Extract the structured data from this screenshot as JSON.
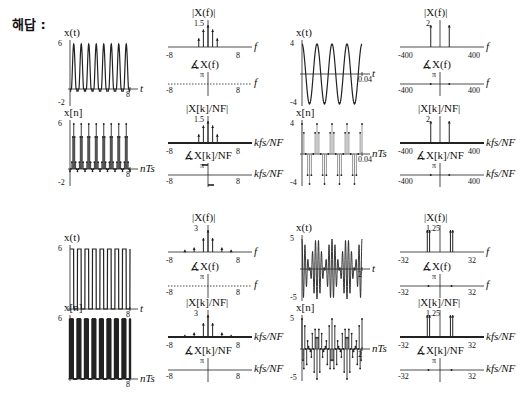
{
  "answer_label": "해답 :",
  "labels": {
    "xt": "x(t)",
    "xn": "x[n]",
    "mag_f": "|X(f)|",
    "phase_f": "∡X(f)",
    "mag_k": "|X[k]/N_F|",
    "phase_k": "∡X[k]/N_F",
    "t": "t",
    "f": "f",
    "nTs": "nT_s",
    "kfs": "kf_s/N_F",
    "pi": "π",
    "neg_pi": "-π"
  },
  "chart_data": [
    {
      "id": "panel-a",
      "type": "line",
      "title": "x(t) periodic pulse train",
      "time": {
        "xlabel": "t",
        "ylabel": "x(t)",
        "xlim": [
          0,
          8
        ],
        "ylim": [
          -2,
          6
        ],
        "ticks_x": [
          "8"
        ],
        "ticks_y": [
          "6",
          "-2"
        ],
        "periods": 8,
        "shape": "raised-cosine pulses"
      },
      "sampled": {
        "xlabel": "nT_s",
        "ylabel": "x[n]",
        "xlim": [
          0,
          8
        ],
        "ylim": [
          -2,
          6
        ],
        "ticks_x": [
          "8"
        ],
        "ticks_y": [
          "6",
          "-2"
        ]
      },
      "mag_f": {
        "xlabel": "f",
        "xlim": [
          -8,
          8
        ],
        "ticks_x": [
          "-8",
          "8"
        ],
        "peak_label": "1.5",
        "impulses": [
          {
            "f": -2,
            "v": 0.6
          },
          {
            "f": -1,
            "v": 1.2
          },
          {
            "f": 0,
            "v": 1.5
          },
          {
            "f": 1,
            "v": 1.2
          },
          {
            "f": 2,
            "v": 0.6
          }
        ]
      },
      "phase_f": {
        "xlabel": "f",
        "xlim": [
          -8,
          8
        ],
        "ticks_x": [
          "-8",
          "8"
        ],
        "ticks_y": [
          "π",
          "-π"
        ],
        "note": "zero phase (dotted)"
      },
      "mag_k": {
        "xlabel": "kf_s/N_F",
        "xlim": [
          -8,
          8
        ],
        "ticks_x": [
          "-8",
          "8"
        ],
        "peak_label": "1.5",
        "impulses": [
          {
            "f": -2,
            "v": 0.6
          },
          {
            "f": -1,
            "v": 1.2
          },
          {
            "f": 0,
            "v": 1.5
          },
          {
            "f": 1,
            "v": 1.2
          },
          {
            "f": 2,
            "v": 0.6
          }
        ]
      },
      "phase_k": {
        "xlabel": "kf_s/N_F",
        "xlim": [
          -8,
          8
        ],
        "ticks_x": [
          "-8",
          "8"
        ],
        "ticks_y": [
          "π",
          "-π"
        ],
        "segments": [
          {
            "f": -0.5,
            "v": 1
          },
          {
            "f": 0.5,
            "v": -1
          }
        ]
      }
    },
    {
      "id": "panel-b",
      "type": "line",
      "title": "x(t) sinusoid",
      "time": {
        "xlabel": "t",
        "ylabel": "x(t)",
        "xlim": [
          0,
          0.04
        ],
        "ylim": [
          -4,
          4
        ],
        "ticks_x": [
          "0.04"
        ],
        "ticks_y": [
          "4",
          "-4"
        ],
        "periods": 4,
        "shape": "cosine, amplitude 4"
      },
      "sampled": {
        "xlabel": "nT_s",
        "ylabel": "x[n]",
        "xlim": [
          0,
          0.04
        ],
        "ylim": [
          -4,
          4
        ],
        "ticks_x": [
          "0.04"
        ],
        "ticks_y": [
          "4",
          "-4"
        ]
      },
      "mag_f": {
        "xlabel": "f",
        "xlim": [
          -400,
          400
        ],
        "ticks_x": [
          "-400",
          "400"
        ],
        "peak_label": "2",
        "impulses": [
          {
            "f": -100,
            "v": 2
          },
          {
            "f": 100,
            "v": 2
          }
        ]
      },
      "phase_f": {
        "xlabel": "f",
        "xlim": [
          -400,
          400
        ],
        "ticks_x": [
          "-400",
          "400"
        ],
        "ticks_y": [
          "π",
          "-π"
        ],
        "points": [
          {
            "f": -100,
            "v": 0
          },
          {
            "f": 100,
            "v": 0
          }
        ]
      },
      "mag_k": {
        "xlabel": "kf_s/N_F",
        "xlim": [
          -400,
          400
        ],
        "ticks_x": [
          "-400",
          "400"
        ],
        "peak_label": "2",
        "impulses": [
          {
            "f": -100,
            "v": 2
          },
          {
            "f": 100,
            "v": 2
          }
        ]
      },
      "phase_k": {
        "xlabel": "kf_s/N_F",
        "xlim": [
          -400,
          400
        ],
        "ticks_x": [
          "-400",
          "400"
        ],
        "ticks_y": [
          "π",
          "-π"
        ],
        "points": [
          {
            "f": -100,
            "v": 0
          },
          {
            "f": 100,
            "v": 0
          }
        ]
      }
    },
    {
      "id": "panel-c",
      "type": "line",
      "title": "x(t) rectangular pulse train",
      "time": {
        "xlabel": "t",
        "ylabel": "x(t)",
        "xlim": [
          0,
          8
        ],
        "ylim": [
          0,
          6
        ],
        "ticks_x": [
          "8"
        ],
        "ticks_y": [
          "6"
        ],
        "periods": 8,
        "shape": "rectangular pulses, 50% duty"
      },
      "sampled": {
        "xlabel": "nT_s",
        "ylabel": "x[n]",
        "xlim": [
          0,
          8
        ],
        "ylim": [
          0,
          6
        ],
        "ticks_x": [
          "8"
        ],
        "ticks_y": [
          "6"
        ]
      },
      "mag_f": {
        "xlabel": "f",
        "xlim": [
          -8,
          8
        ],
        "ticks_x": [
          "-8",
          "8"
        ],
        "peak_label": "3",
        "impulses": [
          {
            "f": -5,
            "v": 0.3
          },
          {
            "f": -3,
            "v": 0.6
          },
          {
            "f": -1,
            "v": 1.9
          },
          {
            "f": 0,
            "v": 3
          },
          {
            "f": 1,
            "v": 1.9
          },
          {
            "f": 3,
            "v": 0.6
          },
          {
            "f": 5,
            "v": 0.3
          }
        ]
      },
      "phase_f": {
        "xlabel": "f",
        "xlim": [
          -8,
          8
        ],
        "ticks_x": [
          "-8",
          "8"
        ],
        "ticks_y": [
          "π",
          "-π"
        ],
        "note": "dots at ±π/2 levels"
      },
      "mag_k": {
        "xlabel": "kf_s/N_F",
        "xlim": [
          -8,
          8
        ],
        "ticks_x": [
          "-8",
          "8"
        ],
        "peak_label": "3",
        "impulses": [
          {
            "f": -5,
            "v": 0.3
          },
          {
            "f": -3,
            "v": 0.6
          },
          {
            "f": -1,
            "v": 1.9
          },
          {
            "f": 0,
            "v": 3
          },
          {
            "f": 1,
            "v": 1.9
          },
          {
            "f": 3,
            "v": 0.6
          },
          {
            "f": 5,
            "v": 0.3
          }
        ]
      },
      "phase_k": {
        "xlabel": "kf_s/N_F",
        "xlim": [
          -8,
          8
        ],
        "ticks_x": [
          "-8",
          "8"
        ],
        "ticks_y": [
          "π",
          "-π"
        ]
      }
    },
    {
      "id": "panel-d",
      "type": "line",
      "title": "x(t) beat signal",
      "time": {
        "xlabel": "t",
        "ylabel": "x(t)",
        "xlim": [
          0,
          2
        ],
        "ylim": [
          -5,
          5
        ],
        "ticks_x": [
          "2"
        ],
        "ticks_y": [
          "5",
          "-5"
        ],
        "shape": "sum of two close cosines"
      },
      "sampled": {
        "xlabel": "nT_s",
        "ylabel": "x[n]",
        "xlim": [
          0,
          2
        ],
        "ylim": [
          -5,
          5
        ],
        "ticks_x": [
          "2"
        ],
        "ticks_y": [
          "5",
          "-5"
        ]
      },
      "mag_f": {
        "xlabel": "f",
        "xlim": [
          -32,
          32
        ],
        "ticks_x": [
          "-32",
          "32"
        ],
        "peak_label": "1.25",
        "impulses": [
          {
            "f": -11,
            "v": 1.25
          },
          {
            "f": -9,
            "v": 1.25
          },
          {
            "f": 9,
            "v": 1.25
          },
          {
            "f": 11,
            "v": 1.25
          }
        ]
      },
      "phase_f": {
        "xlabel": "f",
        "xlim": [
          -32,
          32
        ],
        "ticks_x": [
          "-32",
          "32"
        ],
        "ticks_y": [
          "π",
          "-π"
        ],
        "points": [
          {
            "f": -10,
            "v": 0
          },
          {
            "f": 10,
            "v": 0
          }
        ]
      },
      "mag_k": {
        "xlabel": "kf_s/N_F",
        "xlim": [
          -32,
          32
        ],
        "ticks_x": [
          "-32",
          "32"
        ],
        "peak_label": "1.25",
        "impulses": [
          {
            "f": -11,
            "v": 1.25
          },
          {
            "f": -9,
            "v": 1.25
          },
          {
            "f": 9,
            "v": 1.25
          },
          {
            "f": 11,
            "v": 1.25
          }
        ]
      },
      "phase_k": {
        "xlabel": "kf_s/N_F",
        "xlim": [
          -32,
          32
        ],
        "ticks_x": [
          "-32",
          "32"
        ],
        "ticks_y": [
          "π",
          "-π"
        ],
        "points": [
          {
            "f": -10,
            "v": 0
          },
          {
            "f": 10,
            "v": 0
          }
        ]
      }
    }
  ]
}
